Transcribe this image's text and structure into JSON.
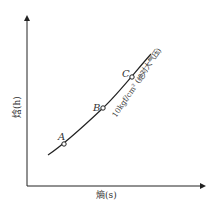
{
  "diagram": {
    "type": "h-s chart",
    "y_axis": {
      "label": "焓(h)",
      "name": "焓",
      "symbol": "h"
    },
    "x_axis": {
      "label": "熵(s)",
      "name": "熵",
      "symbol": "s"
    },
    "curve": {
      "label": "10kgf/cm² (绝对大气压)",
      "description": "isobar"
    },
    "points": [
      {
        "id": "A",
        "label": "A"
      },
      {
        "id": "B",
        "label": "B"
      },
      {
        "id": "C",
        "label": "C"
      }
    ],
    "colors": {
      "line": "#222222",
      "text": "#333333",
      "background": "#ffffff"
    }
  }
}
